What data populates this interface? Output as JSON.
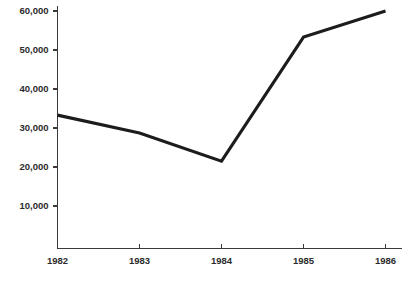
{
  "chart_data": {
    "type": "line",
    "title": "",
    "subtitle": "",
    "xlabel": "",
    "ylabel": "",
    "x": [
      1982,
      1983,
      1984,
      1985,
      1986
    ],
    "categories": [
      "1982",
      "1983",
      "1984",
      "1985",
      "1986"
    ],
    "values": [
      33300,
      28700,
      21500,
      53300,
      60000
    ],
    "series": [
      {
        "name": "",
        "values": [
          33300,
          28700,
          21500,
          53300,
          60000
        ]
      }
    ],
    "xlim": [
      1982,
      1986
    ],
    "ylim": [
      0,
      60000
    ],
    "y_ticks": [
      10000,
      20000,
      30000,
      40000,
      50000,
      60000
    ],
    "y_tick_labels": [
      "10,000",
      "20,000",
      "30,000",
      "40,000",
      "50,000",
      "60,000"
    ],
    "x_ticks": [
      1982,
      1983,
      1984,
      1985,
      1986
    ],
    "x_tick_labels": [
      "1982",
      "1983",
      "1984",
      "1985",
      "1986"
    ],
    "grid": false,
    "legend": false,
    "legend_position": "none",
    "annotations": [],
    "colors": {
      "line": "#1c1c1c",
      "axis": "#3a3a3a",
      "text": "#2b2b2b",
      "background": "#ffffff"
    }
  },
  "axis": {
    "y_labels": [
      {
        "text": "60,000",
        "value": 60000
      },
      {
        "text": "50,000",
        "value": 50000
      },
      {
        "text": "40,000",
        "value": 40000
      },
      {
        "text": "30,000",
        "value": 30000
      },
      {
        "text": "20,000",
        "value": 20000
      },
      {
        "text": "10,000",
        "value": 10000
      }
    ],
    "x_labels": [
      {
        "text": "1982",
        "value": 1982
      },
      {
        "text": "1983",
        "value": 1983
      },
      {
        "text": "1984",
        "value": 1984
      },
      {
        "text": "1985",
        "value": 1985
      },
      {
        "text": "1986",
        "value": 1986
      }
    ]
  }
}
